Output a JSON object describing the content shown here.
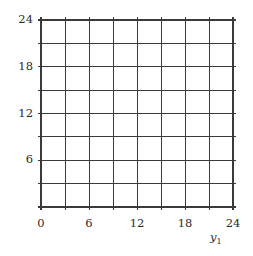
{
  "figure": {
    "background_color": "#ffffff",
    "line_color": "#3a3a3a",
    "text_color": "#2b2b2b"
  },
  "chart_data": {
    "type": "scatter",
    "title": "",
    "xlabel": "y₁",
    "ylabel": "",
    "xlim": [
      0,
      24
    ],
    "ylim": [
      0,
      24
    ],
    "grid": true,
    "grid_step": 3,
    "grid_columns": 8,
    "grid_rows": 8,
    "legend": null,
    "series": [],
    "x": [],
    "values": [],
    "xticks": [
      0,
      6,
      12,
      18,
      24
    ],
    "yticks": [
      0,
      6,
      12,
      18,
      24
    ],
    "xtick_labels": [
      "0",
      "6",
      "12",
      "18",
      "24"
    ],
    "ytick_labels": [
      "",
      "6",
      "12",
      "18",
      "24"
    ],
    "annotations": []
  },
  "axes": {
    "x_label_text": "y",
    "x_label_subscript": "1",
    "x_tick_labels": [
      {
        "text": "0",
        "value": 0
      },
      {
        "text": "6",
        "value": 6
      },
      {
        "text": "12",
        "value": 12
      },
      {
        "text": "18",
        "value": 18
      },
      {
        "text": "24",
        "value": 24
      }
    ],
    "y_tick_labels": [
      {
        "text": "24",
        "value": 24
      },
      {
        "text": "18",
        "value": 18
      },
      {
        "text": "12",
        "value": 12
      },
      {
        "text": "6",
        "value": 6
      }
    ]
  }
}
